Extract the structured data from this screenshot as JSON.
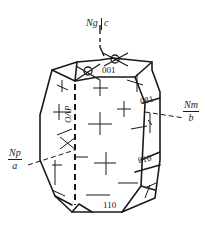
{
  "diagram": {
    "type": "crystal optical orientation diagram",
    "axes": {
      "vertical": {
        "optic": "Ng",
        "crystal": "c"
      },
      "right": {
        "optic": "Nm",
        "crystal": "b"
      },
      "left": {
        "optic": "Np",
        "crystal": "a"
      }
    },
    "plane_label": "OAP",
    "faces": [
      {
        "label": "001"
      },
      {
        "label": "081"
      },
      {
        "label": "010"
      },
      {
        "label": "110"
      }
    ],
    "colors": {
      "line": "#1a1a1a",
      "background": "#ffffff"
    }
  }
}
